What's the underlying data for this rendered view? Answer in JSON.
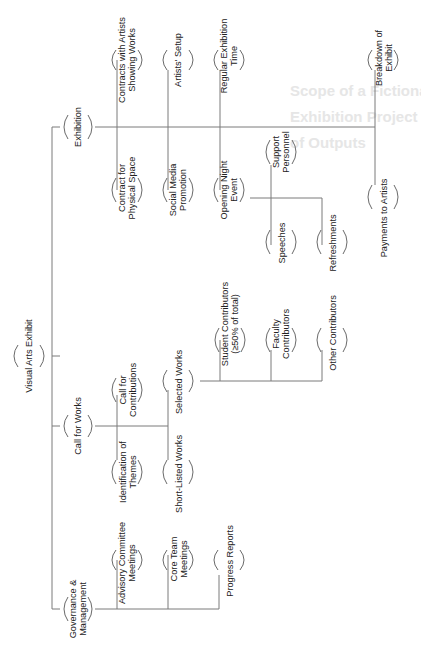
{
  "watermark": {
    "lines": [
      "Scope of a Fictional Visual Arts",
      "Exhibition Project Expressed in Terms",
      "of Outputs"
    ]
  },
  "diagram": {
    "type": "work-breakdown-structure",
    "orientation": "rotated-90-ccw",
    "root": "Visual Arts Exhibit",
    "nodes": {
      "root": [
        "Visual Arts Exhibit"
      ],
      "exhibition": [
        "Exhibition"
      ],
      "call_for_works": [
        "Call for Works"
      ],
      "governance": [
        "Governance &",
        "Management"
      ],
      "contract_space": [
        "Contract for",
        "Physical Space"
      ],
      "contracts_artists": [
        "Contracts with Artists",
        "Showing Works"
      ],
      "social_media": [
        "Social Media",
        "Promotion"
      ],
      "artists_setup": [
        "Artists' Setup"
      ],
      "opening_night": [
        "Opening Night",
        "Event"
      ],
      "regular_time": [
        "Regular Exhibition",
        "Time"
      ],
      "support_personnel": [
        "Support",
        "Personnel"
      ],
      "speeches": [
        "Speeches"
      ],
      "refreshments": [
        "Refreshments"
      ],
      "payments": [
        "Payments to Artists"
      ],
      "breakdown": [
        "Breakdown of",
        "Exhibit"
      ],
      "themes": [
        "Identification of",
        "Themes"
      ],
      "call_contributions": [
        "Call for",
        "Contributions"
      ],
      "short_listed": [
        "Short-Listed Works"
      ],
      "selected": [
        "Selected Works"
      ],
      "student": [
        "Student Contributors",
        "(≥50% of total)"
      ],
      "faculty": [
        "Faculty",
        "Contributors"
      ],
      "other": [
        "Other Contributors"
      ],
      "advisory": [
        "Advisory Committee",
        "Meetings"
      ],
      "core_team": [
        "Core Team",
        "Meetings"
      ],
      "progress": [
        "Progress Reports"
      ]
    },
    "hierarchy": [
      {
        "label": "Visual Arts Exhibit",
        "children": [
          {
            "label": "Exhibition",
            "children": [
              "Contract for Physical Space",
              "Contracts with Artists Showing Works",
              "Social Media Promotion",
              "Artists' Setup",
              {
                "label": "Opening Night Event",
                "children": [
                  "Support Personnel",
                  "Speeches",
                  "Refreshments"
                ]
              },
              "Regular Exhibition Time",
              "Payments to Artists",
              "Breakdown of Exhibit"
            ]
          },
          {
            "label": "Call for Works",
            "children": [
              "Identification of Themes",
              "Call for Contributions",
              "Short-Listed Works",
              {
                "label": "Selected Works",
                "children": [
                  "Student Contributors (≥50% of total)",
                  "Faculty Contributors",
                  "Other Contributors"
                ]
              }
            ]
          },
          {
            "label": "Governance & Management",
            "children": [
              "Advisory Committee Meetings",
              "Core Team Meetings",
              "Progress Reports"
            ]
          }
        ]
      }
    ],
    "colors": {
      "line": "#7a7a7a",
      "text": "#222222",
      "background": "#ffffff"
    }
  }
}
